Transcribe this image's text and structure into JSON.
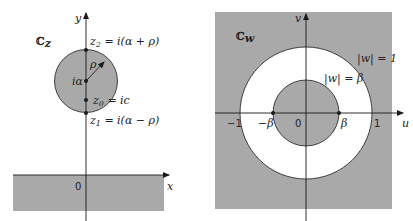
{
  "colors": {
    "shade": "#a9a9a9",
    "line": "#1a1a1a",
    "background": "#ffffff"
  },
  "left_panel": {
    "plane_label": "ℂ",
    "plane_subscript": "z",
    "x_axis_label": "x",
    "y_axis_label": "y",
    "origin_label": "0",
    "center_label": "iα",
    "radius_label": "ρ",
    "z2_label": "z",
    "z2_sub": "2",
    "z2_expr": " = i(α + ρ)",
    "z0_label": "z",
    "z0_sub": "0",
    "z0_expr": " = ic",
    "z1_label": "z",
    "z1_sub": "1",
    "z1_expr": " = i(α − ρ)",
    "region": "shaded disk |z − iα| < ρ and shaded lower half-plane y < 0"
  },
  "right_panel": {
    "plane_label": "ℂ",
    "plane_subscript": "w",
    "u_axis_label": "u",
    "v_axis_label": "v",
    "origin_label": "0",
    "tick_neg1": "−1",
    "tick_pos1": "1",
    "tick_negbeta": "−β",
    "tick_posbeta": "β",
    "outer_circle_label": "|w| = 1",
    "inner_circle_label": "|w| = β",
    "region": "white annulus β < |w| < 1; shaded |w| < β and |w| > 1"
  }
}
